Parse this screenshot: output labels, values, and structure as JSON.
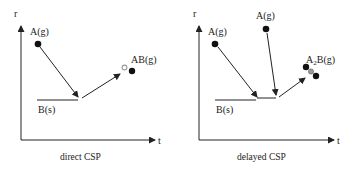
{
  "panels": [
    {
      "caption": "direct CSP",
      "y_axis_label": "r",
      "x_axis_label": "t",
      "labels": {
        "gas_a": "A(g)",
        "solid_b": "B(s)",
        "product": "AB(g)"
      }
    },
    {
      "caption": "delayed CSP",
      "y_axis_label": "r",
      "x_axis_label": "t",
      "labels": {
        "gas_a_first": "A(g)",
        "gas_a_second": "A(g)",
        "solid_b": "B(s)",
        "product_main": "A",
        "product_sub": "2",
        "product_rest": "B(g)"
      }
    }
  ],
  "colors": {
    "line": "#222222",
    "dot": "#111111",
    "hollow_dot": "#9a9a9a"
  }
}
